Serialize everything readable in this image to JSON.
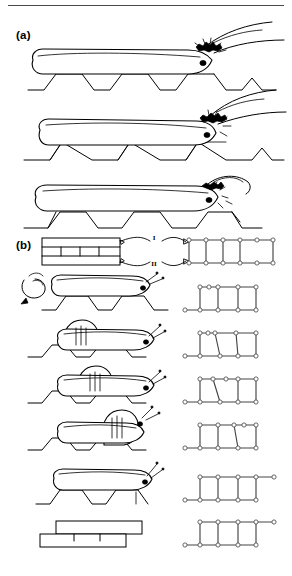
{
  "figure": {
    "kind": "scientific-line-drawing",
    "width": 292,
    "height": 576,
    "background": "#ffffff",
    "ink_color": "#000000",
    "rule_color": "#4a4a4a",
    "node_color": "#ffffff",
    "node_stroke": "#555555",
    "edge_color": "#444444"
  },
  "panels": [
    {
      "id": "a",
      "label": "(a)",
      "description": "Three sequential side views of a leaf-folding caterpillar drawing the serrated leaf margin together with silk.",
      "stages": [
        {
          "name": "stage-a-1",
          "caption": "",
          "leaf_teeth": 5,
          "silk_taut": false
        },
        {
          "name": "stage-a-2",
          "caption": "",
          "leaf_teeth": 5,
          "silk_taut": true
        },
        {
          "name": "stage-a-3",
          "caption": "",
          "leaf_teeth": 5,
          "silk_taut": false
        }
      ]
    },
    {
      "id": "b",
      "label": "(b)",
      "description": "Schematic cross-section of the folded leaf and its graph (ladder) representation, followed by six stages pairing a caterpillar drawing with its ladder graph.",
      "key": {
        "surface_labels": [
          "I",
          "II"
        ],
        "surface_I": "I",
        "surface_II": "II",
        "block_compartments": 4
      },
      "stages": [
        {
          "name": "stage-b-1",
          "graph": {
            "top_nodes": 6,
            "bottom_nodes": 6,
            "rungs": 5,
            "top_tail": false,
            "bottom_tail": false,
            "arch": 0
          }
        },
        {
          "name": "stage-b-2",
          "graph": {
            "top_nodes": 6,
            "bottom_nodes": 6,
            "rungs": 4,
            "top_tail": false,
            "bottom_tail": true,
            "arch": 1
          }
        },
        {
          "name": "stage-b-3",
          "graph": {
            "top_nodes": 6,
            "bottom_nodes": 6,
            "rungs": 4,
            "top_tail": false,
            "bottom_tail": true,
            "arch": 1
          }
        },
        {
          "name": "stage-b-4",
          "graph": {
            "top_nodes": 6,
            "bottom_nodes": 6,
            "rungs": 4,
            "top_tail": false,
            "bottom_tail": true,
            "arch": 1
          }
        },
        {
          "name": "stage-b-5",
          "graph": {
            "top_nodes": 6,
            "bottom_nodes": 6,
            "rungs": 4,
            "top_tail": true,
            "bottom_tail": true,
            "arch": 0
          }
        },
        {
          "name": "stage-b-6",
          "graph": {
            "top_nodes": 6,
            "bottom_nodes": 6,
            "rungs": 4,
            "top_tail": true,
            "bottom_tail": true,
            "arch": 0
          }
        }
      ]
    }
  ]
}
